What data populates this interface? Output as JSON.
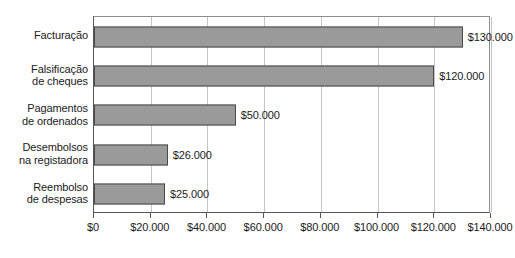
{
  "chart_data": {
    "type": "bar",
    "orientation": "horizontal",
    "title": "",
    "xlabel": "",
    "ylabel": "",
    "categories": [
      "Facturação",
      "Falsificação\nde cheques",
      "Pagamentos\nde ordenados",
      "Desembolsos\nna registadora",
      "Reembolso\nde despesas"
    ],
    "values": [
      130000,
      120000,
      50000,
      26000,
      25000
    ],
    "value_labels": [
      "$130.000",
      "$120.000",
      "$50.000",
      "$26.000",
      "$25.000"
    ],
    "xlim": [
      0,
      140000
    ],
    "xticks": [
      0,
      20000,
      40000,
      60000,
      80000,
      100000,
      120000,
      140000
    ],
    "xtick_labels": [
      "$0",
      "$20.000",
      "$40.000",
      "$60.000",
      "$80.000",
      "$100.000",
      "$120.000",
      "$140.000"
    ],
    "grid": true,
    "grid_axis": "x",
    "legend": false,
    "bar_color": "#9a9a9a",
    "bar_border_color": "#4a4a4c",
    "grid_color": "#c3c4c6",
    "axis_color": "#55565a",
    "background": "#ffffff"
  }
}
